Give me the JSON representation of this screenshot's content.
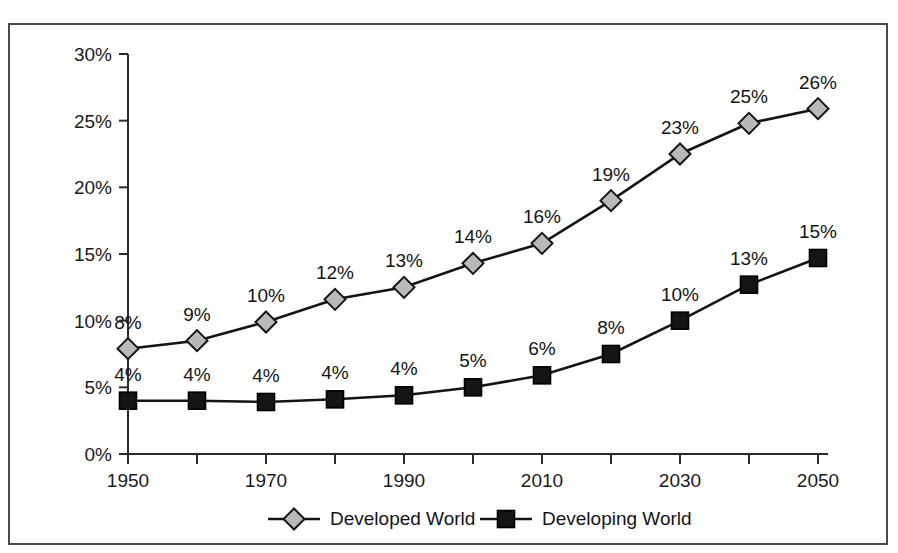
{
  "chart_data": {
    "type": "line",
    "title": "",
    "xlabel": "",
    "ylabel": "",
    "x": [
      1950,
      1960,
      1970,
      1980,
      1990,
      2000,
      2010,
      2020,
      2030,
      2040,
      2050
    ],
    "x_tick_labels": [
      "1950",
      "",
      "1970",
      "",
      "1990",
      "",
      "2010",
      "",
      "2030",
      "",
      "2050"
    ],
    "y_tick_labels": [
      "0%",
      "5%",
      "10%",
      "15%",
      "20%",
      "25%",
      "30%"
    ],
    "y_ticks": [
      0,
      5,
      10,
      15,
      20,
      25,
      30
    ],
    "ylim": [
      0,
      30
    ],
    "xlim": [
      1950,
      2050
    ],
    "grid": false,
    "legend_position": "bottom",
    "series": [
      {
        "name": "Developed World",
        "marker": "diamond",
        "color": "#b9b9b9",
        "values": [
          8,
          9,
          10,
          12,
          13,
          14,
          16,
          19,
          23,
          25,
          26
        ],
        "plotted_values": [
          7.9,
          8.5,
          9.9,
          11.6,
          12.5,
          14.3,
          15.8,
          19.0,
          22.5,
          24.8,
          25.9
        ],
        "labels": [
          "8%",
          "9%",
          "10%",
          "12%",
          "13%",
          "14%",
          "16%",
          "19%",
          "23%",
          "25%",
          "26%"
        ]
      },
      {
        "name": "Developing World",
        "marker": "square",
        "color": "#151515",
        "values": [
          4,
          4,
          4,
          4,
          4,
          5,
          6,
          8,
          10,
          13,
          15
        ],
        "plotted_values": [
          4.0,
          4.0,
          3.9,
          4.1,
          4.4,
          5.0,
          5.9,
          7.5,
          10.0,
          12.7,
          14.7
        ],
        "labels": [
          "4%",
          "4%",
          "4%",
          "4%",
          "4%",
          "5%",
          "6%",
          "8%",
          "10%",
          "13%",
          "15%"
        ]
      }
    ],
    "legend": [
      {
        "label": "Developed World",
        "marker": "diamond"
      },
      {
        "label": "Developing World",
        "marker": "square"
      }
    ]
  }
}
